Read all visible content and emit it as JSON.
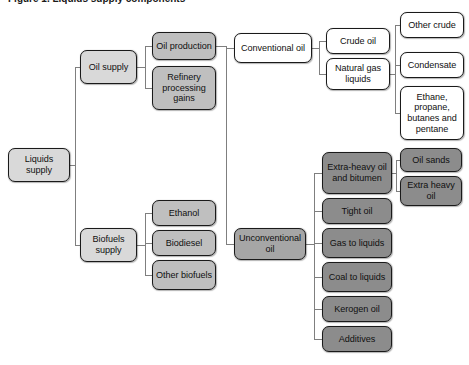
{
  "title": "Figure 1. Liquids supply components",
  "colors": {
    "white": "#ffffff",
    "light_grey": "#d9d9d9",
    "mid_grey": "#bfbfbf",
    "dark_grey": "#a6a6a6",
    "darker_grey": "#8c8c8c",
    "border": "#1a1a1a"
  },
  "chart_data": {
    "type": "diagram",
    "diagram_type": "hierarchy-tree",
    "orientation": "left-to-right",
    "title": "Figure 1. Liquids supply components",
    "levels": 5,
    "root": "Liquids supply"
  },
  "nodes": {
    "liquids_supply": {
      "label": "Liquids supply",
      "x": 8,
      "y": 148,
      "w": 62,
      "h": 34,
      "fill": "light"
    },
    "oil_supply": {
      "label": "Oil supply",
      "x": 80,
      "y": 50,
      "w": 57,
      "h": 34,
      "fill": "light"
    },
    "biofuels_supply": {
      "label": "Biofuels supply",
      "x": 80,
      "y": 228,
      "w": 57,
      "h": 34,
      "fill": "light"
    },
    "oil_production": {
      "label": "Oil production",
      "x": 152,
      "y": 32,
      "w": 64,
      "h": 28,
      "fill": "mid"
    },
    "refinery_gains": {
      "label": "Refinery processing gains",
      "x": 152,
      "y": 66,
      "w": 64,
      "h": 44,
      "fill": "mid"
    },
    "ethanol": {
      "label": "Ethanol",
      "x": 152,
      "y": 200,
      "w": 64,
      "h": 26,
      "fill": "mid"
    },
    "biodiesel": {
      "label": "Biodiesel",
      "x": 152,
      "y": 230,
      "w": 64,
      "h": 26,
      "fill": "mid"
    },
    "other_biofuels": {
      "label": "Other biofuels",
      "x": 152,
      "y": 260,
      "w": 64,
      "h": 30,
      "fill": "mid"
    },
    "conventional_oil": {
      "label": "Conventional oil",
      "x": 234,
      "y": 33,
      "w": 78,
      "h": 30,
      "fill": "white"
    },
    "unconventional_oil": {
      "label": "Unconventional oil",
      "x": 234,
      "y": 228,
      "w": 72,
      "h": 32,
      "fill": "dark"
    },
    "crude_oil": {
      "label": "Crude oil",
      "x": 326,
      "y": 28,
      "w": 64,
      "h": 26,
      "fill": "white"
    },
    "natural_gas_liquids": {
      "label": "Natural gas liquids",
      "x": 326,
      "y": 58,
      "w": 64,
      "h": 32,
      "fill": "white"
    },
    "other_crude": {
      "label": "Other crude",
      "x": 400,
      "y": 12,
      "w": 64,
      "h": 26,
      "fill": "white"
    },
    "condensate": {
      "label": "Condensate",
      "x": 400,
      "y": 52,
      "w": 64,
      "h": 26,
      "fill": "white"
    },
    "ethane_group": {
      "label": "Ethane, propane, butanes and pentane",
      "x": 400,
      "y": 86,
      "w": 64,
      "h": 54,
      "fill": "white"
    },
    "extra_heavy_oil": {
      "label": "Extra-heavy oil and bitumen",
      "x": 322,
      "y": 152,
      "w": 70,
      "h": 42,
      "fill": "darker"
    },
    "tight_oil": {
      "label": "Tight oil",
      "x": 322,
      "y": 198,
      "w": 70,
      "h": 26,
      "fill": "darker"
    },
    "gas_to_liquids": {
      "label": "Gas to liquids",
      "x": 322,
      "y": 228,
      "w": 70,
      "h": 30,
      "fill": "darker"
    },
    "coal_to_liquids": {
      "label": "Coal to liquids",
      "x": 322,
      "y": 262,
      "w": 70,
      "h": 30,
      "fill": "darker"
    },
    "kerogen_oil": {
      "label": "Kerogen oil",
      "x": 322,
      "y": 296,
      "w": 70,
      "h": 26,
      "fill": "darker"
    },
    "additives": {
      "label": "Additives",
      "x": 322,
      "y": 326,
      "w": 70,
      "h": 26,
      "fill": "darker"
    },
    "oil_sands": {
      "label": "Oil sands",
      "x": 400,
      "y": 148,
      "w": 62,
      "h": 24,
      "fill": "darker"
    },
    "extra_heavy": {
      "label": "Extra heavy oil",
      "x": 400,
      "y": 176,
      "w": 62,
      "h": 30,
      "fill": "darker"
    }
  }
}
